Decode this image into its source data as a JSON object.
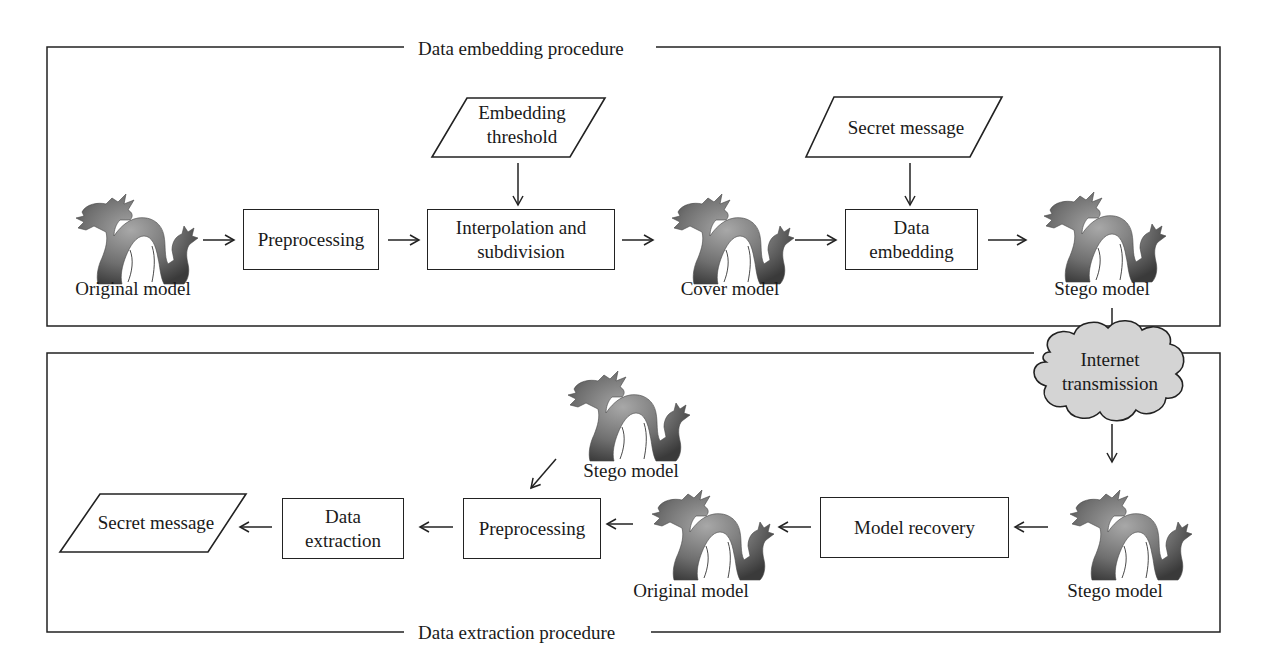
{
  "diagram": {
    "embedding_section": {
      "title": "Data embedding procedure",
      "nodes": {
        "original_model": "Original model",
        "preprocessing": "Preprocessing",
        "embedding_threshold_line1": "Embedding",
        "embedding_threshold_line2": "threshold",
        "interpolation_line1": "Interpolation and",
        "interpolation_line2": "subdivision",
        "cover_model": "Cover model",
        "secret_message": "Secret message",
        "data_embedding_line1": "Data",
        "data_embedding_line2": "embedding",
        "stego_model": "Stego model"
      }
    },
    "transmission": {
      "line1": "Internet",
      "line2": "transmission"
    },
    "extraction_section": {
      "title": "Data extraction procedure",
      "nodes": {
        "stego_model_in": "Stego model",
        "model_recovery": "Model recovery",
        "original_model": "Original model",
        "stego_model_side": "Stego model",
        "preprocessing": "Preprocessing",
        "data_extraction_line1": "Data",
        "data_extraction_line2": "extraction",
        "secret_message": "Secret message"
      }
    },
    "colors": {
      "stroke": "#222222",
      "cloud_fill": "#d4d4d4",
      "dragon_fill": "#6e6e6e"
    }
  }
}
